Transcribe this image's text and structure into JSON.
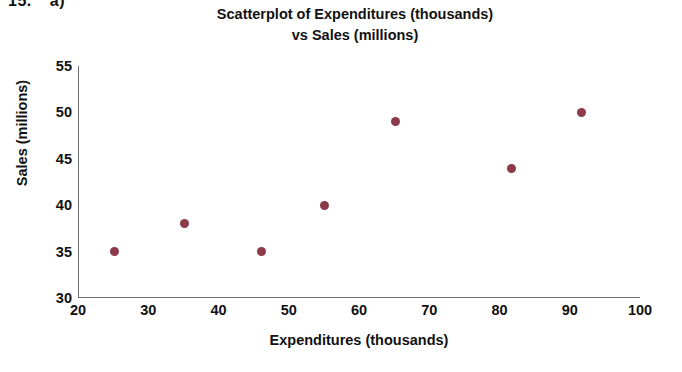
{
  "exercise": {
    "number": "15.",
    "part": "a)"
  },
  "chart_data": {
    "type": "scatter",
    "title_line1": "Scatterplot of Expenditures (thousands)",
    "title_line2": "vs Sales (millions)",
    "xlabel": "Expenditures (thousands)",
    "ylabel": "Sales (millions)",
    "xlim": [
      20,
      100
    ],
    "ylim": [
      30,
      55
    ],
    "xticks": [
      20,
      30,
      40,
      50,
      60,
      70,
      80,
      90,
      100
    ],
    "yticks": [
      30,
      35,
      40,
      45,
      50,
      55
    ],
    "grid": false,
    "legend": null,
    "point_color": "#8c3a4a",
    "axis_color": "#6e6e6e",
    "points": [
      {
        "x": 25,
        "y": 35
      },
      {
        "x": 35,
        "y": 38
      },
      {
        "x": 46,
        "y": 35
      },
      {
        "x": 55,
        "y": 40
      },
      {
        "x": 65,
        "y": 49
      },
      {
        "x": 81.5,
        "y": 44
      },
      {
        "x": 91.5,
        "y": 50
      }
    ]
  }
}
